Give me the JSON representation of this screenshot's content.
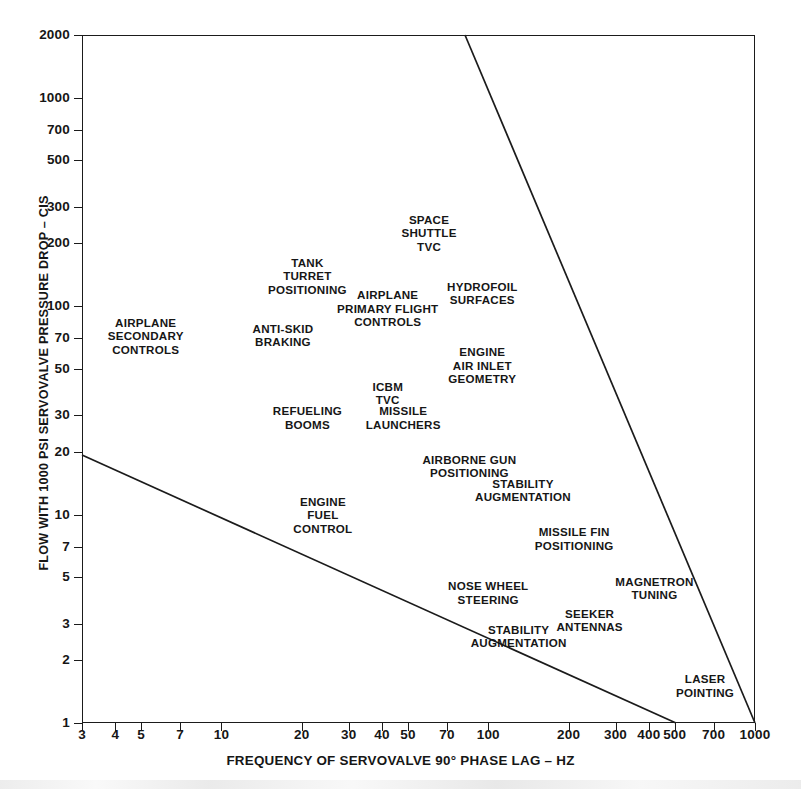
{
  "chart_data": {
    "type": "scatter",
    "title": "",
    "xlabel": "FREQUENCY OF SERVOVALVE 90° PHASE LAG – HZ",
    "ylabel": "FLOW WITH 1000 PSI SERVOVALVE PRESSURE DROP – CIS",
    "xscale": "log",
    "yscale": "log",
    "xlim": [
      3,
      1000
    ],
    "ylim": [
      1,
      2000
    ],
    "grid": false,
    "legend": null,
    "xticks": [
      {
        "value": 3,
        "label": "3"
      },
      {
        "value": 4,
        "label": "4"
      },
      {
        "value": 5,
        "label": "5"
      },
      {
        "value": 7,
        "label": "7"
      },
      {
        "value": 10,
        "label": "10"
      },
      {
        "value": 20,
        "label": "20"
      },
      {
        "value": 30,
        "label": "30"
      },
      {
        "value": 40,
        "label": "40"
      },
      {
        "value": 50,
        "label": "50"
      },
      {
        "value": 70,
        "label": "70"
      },
      {
        "value": 100,
        "label": "100"
      },
      {
        "value": 200,
        "label": "200"
      },
      {
        "value": 300,
        "label": "300"
      },
      {
        "value": 400,
        "label": "400"
      },
      {
        "value": 500,
        "label": "500"
      },
      {
        "value": 700,
        "label": "700"
      },
      {
        "value": 1000,
        "label": "1000"
      }
    ],
    "yticks": [
      {
        "value": 1,
        "label": "1"
      },
      {
        "value": 2,
        "label": "2"
      },
      {
        "value": 3,
        "label": "3"
      },
      {
        "value": 5,
        "label": "5"
      },
      {
        "value": 7,
        "label": "7"
      },
      {
        "value": 10,
        "label": "10"
      },
      {
        "value": 20,
        "label": "20"
      },
      {
        "value": 30,
        "label": "30"
      },
      {
        "value": 50,
        "label": "50"
      },
      {
        "value": 70,
        "label": "70"
      },
      {
        "value": 100,
        "label": "100"
      },
      {
        "value": 200,
        "label": "200"
      },
      {
        "value": 300,
        "label": "300"
      },
      {
        "value": 500,
        "label": "500"
      },
      {
        "value": 700,
        "label": "700"
      },
      {
        "value": 1000,
        "label": "1000"
      },
      {
        "value": 2000,
        "label": "2000"
      }
    ],
    "annotations": [
      {
        "name": "airplane-secondary-controls",
        "text": "AIRPLANE\nSECONDARY\nCONTROLS",
        "x": 5.2,
        "y": 72
      },
      {
        "name": "anti-skid-braking",
        "text": "ANTI-SKID\nBRAKING",
        "x": 17,
        "y": 72
      },
      {
        "name": "tank-turret-positioning",
        "text": "TANK\nTURRET\nPOSITIONING",
        "x": 21,
        "y": 140
      },
      {
        "name": "airplane-primary-flight-controls",
        "text": "AIRPLANE\nPRIMARY FLIGHT\nCONTROLS",
        "x": 42,
        "y": 98
      },
      {
        "name": "space-shuttle-tvc",
        "text": "SPACE\nSHUTTLE\nTVC",
        "x": 60,
        "y": 225
      },
      {
        "name": "hydrofoil-surfaces",
        "text": "HYDROFOIL\nSURFACES",
        "x": 95,
        "y": 115
      },
      {
        "name": "engine-air-inlet-geometry",
        "text": "ENGINE\nAIR INLET\nGEOMETRY",
        "x": 95,
        "y": 52
      },
      {
        "name": "icbm-tvc",
        "text": "ICBM\nTVC",
        "x": 42,
        "y": 38
      },
      {
        "name": "refueling-booms",
        "text": "REFUELING\nBOOMS",
        "x": 21,
        "y": 29
      },
      {
        "name": "missile-launchers",
        "text": "MISSILE\nLAUNCHERS",
        "x": 48,
        "y": 29
      },
      {
        "name": "airborne-gun-positioning",
        "text": "AIRBORNE GUN\nPOSITIONING",
        "x": 85,
        "y": 17
      },
      {
        "name": "stability-augmentation-upper",
        "text": "STABILITY\nAUGMENTATION",
        "x": 135,
        "y": 13
      },
      {
        "name": "engine-fuel-control",
        "text": "ENGINE\nFUEL\nCONTROL",
        "x": 24,
        "y": 10
      },
      {
        "name": "missile-fin-positioning",
        "text": "MISSILE FIN\nPOSITIONING",
        "x": 210,
        "y": 7.6
      },
      {
        "name": "nose-wheel-steering",
        "text": "NOSE WHEEL\nSTEERING",
        "x": 100,
        "y": 4.2
      },
      {
        "name": "magnetron-tuning",
        "text": "MAGNETRON\nTUNING",
        "x": 420,
        "y": 4.4
      },
      {
        "name": "seeker-antennas",
        "text": "SEEKER\nANTENNAS",
        "x": 240,
        "y": 3.1
      },
      {
        "name": "stability-augmentation-lower",
        "text": "STABILITY\nAUGMENTATION",
        "x": 130,
        "y": 2.6
      },
      {
        "name": "laser-pointing",
        "text": "LASER\nPOINTING",
        "x": 650,
        "y": 1.5
      }
    ],
    "boundary_lines": [
      {
        "name": "upper-capability-boundary",
        "description": "Upper-right servovalve capability limit line",
        "points": [
          [
            24,
            2000
          ],
          [
            1000,
            1
          ]
        ]
      },
      {
        "name": "lower-capability-boundary",
        "description": "Lower servovalve capability limit line",
        "points": [
          [
            3,
            20
          ],
          [
            500,
            1
          ]
        ]
      }
    ]
  }
}
